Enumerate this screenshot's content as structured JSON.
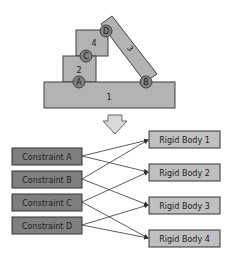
{
  "mechanism": {
    "bodies": [
      {
        "id": "1",
        "label": "1"
      },
      {
        "id": "2",
        "label": "2"
      },
      {
        "id": "3",
        "label": "3"
      },
      {
        "id": "4",
        "label": "4"
      }
    ],
    "joints": [
      {
        "id": "A",
        "label": "A"
      },
      {
        "id": "B",
        "label": "B"
      },
      {
        "id": "C",
        "label": "C"
      },
      {
        "id": "D",
        "label": "D"
      }
    ]
  },
  "graph": {
    "constraints": [
      {
        "label": "Constraint A"
      },
      {
        "label": "Constraint B"
      },
      {
        "label": "Constraint C"
      },
      {
        "label": "Constraint D"
      }
    ],
    "rigid_bodies": [
      {
        "label": "Rigid Body 1"
      },
      {
        "label": "Rigid Body 2"
      },
      {
        "label": "Rigid Body 3"
      },
      {
        "label": "Rigid Body 4"
      }
    ],
    "edges": [
      {
        "from": "Constraint A",
        "to": "Rigid Body 1"
      },
      {
        "from": "Constraint A",
        "to": "Rigid Body 2"
      },
      {
        "from": "Constraint B",
        "to": "Rigid Body 1"
      },
      {
        "from": "Constraint B",
        "to": "Rigid Body 3"
      },
      {
        "from": "Constraint C",
        "to": "Rigid Body 2"
      },
      {
        "from": "Constraint C",
        "to": "Rigid Body 4"
      },
      {
        "from": "Constraint D",
        "to": "Rigid Body 3"
      },
      {
        "from": "Constraint D",
        "to": "Rigid Body 4"
      }
    ]
  },
  "colors": {
    "body_fill": "#b3b3b3",
    "joint_fill": "#808080",
    "constraint_fill": "#7f7f7f",
    "rigid_body_fill": "#bfbfbf",
    "stroke": "#404040",
    "arrow_fill": "#d9d9d9"
  }
}
